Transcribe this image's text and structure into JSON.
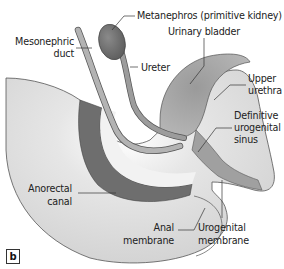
{
  "figure": {
    "panel_letter": "b",
    "colors": {
      "background": "#ffffff",
      "body_light": "#d9d9d9",
      "body_mid": "#bdbdbd",
      "duct": "#a8a8a8",
      "dark_tissue": "#6e6e6e",
      "outline": "#555555"
    },
    "labels": {
      "metanephros": "Metanephros (primitive kidney)",
      "mesonephric_duct_line1": "Mesonephric",
      "mesonephric_duct_line2": "duct",
      "ureter": "Ureter",
      "urinary_bladder": "Urinary bladder",
      "upper_urethra_line1": "Upper",
      "upper_urethra_line2": "urethra",
      "definitive_ug_sinus_line1": "Definitive",
      "definitive_ug_sinus_line2": "urogenital",
      "definitive_ug_sinus_line3": "sinus",
      "anorectal_canal_line1": "Anorectal",
      "anorectal_canal_line2": "canal",
      "anal_membrane_line1": "Anal",
      "anal_membrane_line2": "membrane",
      "urogenital_membrane_line1": "Urogenital",
      "urogenital_membrane_line2": "membrane"
    }
  }
}
